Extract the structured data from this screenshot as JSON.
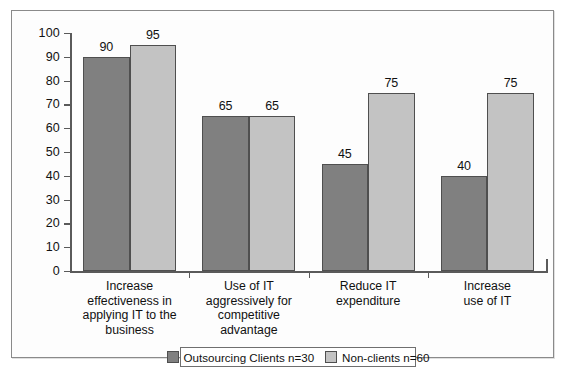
{
  "chart_data": {
    "type": "bar",
    "title": "",
    "xlabel": "",
    "ylabel": "",
    "ylim": [
      0,
      100
    ],
    "ytick_step": 10,
    "yticks": [
      100,
      90,
      80,
      70,
      60,
      50,
      40,
      30,
      20,
      10,
      0
    ],
    "grid": false,
    "legend_position": "bottom-center",
    "categories": [
      "Increase effectiveness in applying IT to the business",
      "Use of IT aggressively for competitive advantage",
      "Reduce IT expenditure",
      "Increase use of IT"
    ],
    "category_lines": [
      [
        "Increase",
        "effectiveness in",
        "applying IT to the",
        "business"
      ],
      [
        "Use of IT",
        "aggressively for",
        "competitive",
        "advantage"
      ],
      [
        "Reduce IT",
        "expenditure"
      ],
      [
        "Increase",
        "use of IT"
      ]
    ],
    "series": [
      {
        "name": "Outsourcing Clients n=30",
        "color": "#808080",
        "values": [
          90,
          65,
          45,
          40
        ]
      },
      {
        "name": "Non-clients n=60",
        "color": "#c3c3c3",
        "values": [
          95,
          65,
          75,
          75
        ]
      }
    ]
  },
  "legend": {
    "entries": [
      {
        "label": "Outsourcing Clients n=30",
        "swatch": "dark"
      },
      {
        "label": "Non-clients n=60",
        "swatch": "light"
      }
    ]
  },
  "colors": {
    "series_dark": "#808080",
    "series_light": "#c3c3c3",
    "axis": "#5a5a5a",
    "frame": "#8a8a8a",
    "text": "#111111"
  }
}
